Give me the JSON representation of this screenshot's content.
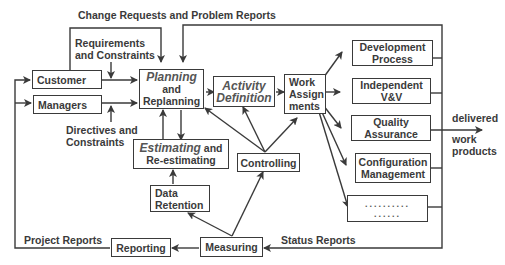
{
  "diagram": {
    "colors": {
      "stroke": "#3a3a3a",
      "text": "#3a3a3a",
      "background": "#ffffff"
    },
    "nodes": {
      "customer": {
        "label": "Customer"
      },
      "managers": {
        "label": "Managers"
      },
      "planning": {
        "line1": "Planning",
        "line2": "and",
        "line3": "Replanning"
      },
      "activity": {
        "line1": "Activity",
        "line2": "Definition"
      },
      "work": {
        "line1": "Work",
        "line2": "Assign",
        "line3": "ments"
      },
      "estimating": {
        "line1_italic": "Estimating",
        "line1_rest": " and",
        "line2": "Re-estimating"
      },
      "controlling": {
        "label": "Controlling"
      },
      "data_retention": {
        "line1": "Data",
        "line2": "Retention"
      },
      "reporting": {
        "label": "Reporting"
      },
      "measuring": {
        "label": "Measuring"
      },
      "dev_process": {
        "line1": "Development",
        "line2": "Process"
      },
      "ivv": {
        "line1": "Independent",
        "line2": "V&V"
      },
      "qa": {
        "line1": "Quality",
        "line2": "Assurance"
      },
      "cm": {
        "line1": "Configuration",
        "line2": "Management"
      },
      "other": {
        "line1": "..........",
        "line2": "......"
      }
    },
    "labels": {
      "change_requests": "Change Requests and Problem Reports",
      "requirements_1": "Requirements",
      "requirements_2": "and Constraints",
      "directives_1": "Directives and",
      "directives_2": "Constraints",
      "delivered": "delivered",
      "work_products_1": "work",
      "work_products_2": "products",
      "project_reports": "Project Reports",
      "status_reports": "Status Reports"
    }
  }
}
